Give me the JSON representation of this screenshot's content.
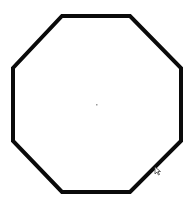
{
  "canvas": {
    "width": 193,
    "height": 207,
    "background": "#ffffff"
  },
  "shape": {
    "type": "octagon",
    "points": "62,16 130,16 181,68 181,141 130,192 62,192 13,141 13,68",
    "stroke": "#0a0a0a",
    "stroke_width": 4,
    "fill": "#ffffff"
  },
  "center_mark": {
    "x": 96,
    "y": 104,
    "color": "#9a9a9a"
  },
  "cursor": {
    "icon": "mouse-pointer-icon",
    "x": 155,
    "y": 167,
    "color": "#444444"
  }
}
